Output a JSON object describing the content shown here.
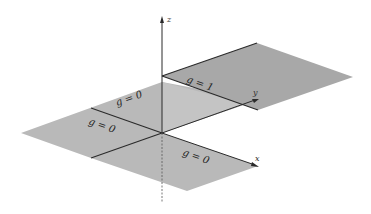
{
  "figure": {
    "type": "3d-axes-diagram",
    "colors": {
      "upper_plane": "#a8a8a8",
      "lower_plane": "#b9b9b9",
      "mid_region": "#c4c4c4",
      "axis": "#2a2a2a",
      "background": "#ffffff"
    }
  },
  "axes": {
    "x": "x",
    "y": "y",
    "z": "z"
  },
  "regions": [
    {
      "id": "upper",
      "label": "g = 1"
    },
    {
      "id": "back-left",
      "label": "g = 0"
    },
    {
      "id": "front-left",
      "label": "g = 0"
    },
    {
      "id": "front-right",
      "label": "g = 0"
    }
  ]
}
